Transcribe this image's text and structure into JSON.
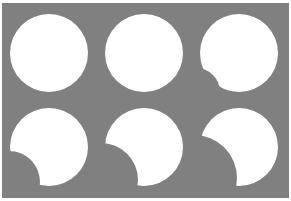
{
  "figure": {
    "width": 291,
    "height": 201,
    "background_color": "#ffffff",
    "panel": {
      "fill_color": "#808080",
      "x": 2,
      "y": 3,
      "width": 287,
      "height": 195
    },
    "shape_fill_color": "#ffffff",
    "rows": 2,
    "columns": 3
  },
  "chart_data": {
    "type": "scatter",
    "xlabel": "",
    "ylabel": "",
    "grid": false,
    "legend": null,
    "background_color": "#808080",
    "shape_color": "#ffffff",
    "categories": [
      "top-left",
      "top-middle",
      "top-right",
      "bottom-left",
      "bottom-middle",
      "bottom-right"
    ],
    "values": [
      0,
      8,
      22,
      38,
      55,
      72
    ],
    "series": [
      {
        "name": "occlusion_percent",
        "values": [
          0,
          8,
          22,
          38,
          55,
          72
        ]
      },
      {
        "name": "notch_radius_px",
        "values": [
          0,
          14,
          24,
          31,
          37,
          43
        ]
      }
    ],
    "ylim": [
      0,
      100
    ],
    "shapes": [
      {
        "index": 0,
        "name": "top-left",
        "cx": 49,
        "cy": 53,
        "r": 39,
        "notch_cx": 0,
        "notch_cy": 0,
        "notch_r": 0,
        "occlusion_percent": 0
      },
      {
        "index": 1,
        "name": "top-middle",
        "cx": 144,
        "cy": 53,
        "r": 39,
        "notch_cx": 101,
        "notch_cy": 95,
        "notch_r": 14,
        "occlusion_percent": 8
      },
      {
        "index": 2,
        "name": "top-right",
        "cx": 239,
        "cy": 53,
        "r": 39,
        "notch_cx": 196,
        "notch_cy": 92,
        "notch_r": 24,
        "occlusion_percent": 22
      },
      {
        "index": 3,
        "name": "bottom-left",
        "cx": 49,
        "cy": 147,
        "r": 39,
        "notch_cx": 9,
        "notch_cy": 182,
        "notch_r": 31,
        "occlusion_percent": 38
      },
      {
        "index": 4,
        "name": "bottom-middle",
        "cx": 144,
        "cy": 147,
        "r": 39,
        "notch_cx": 101,
        "notch_cy": 180,
        "notch_r": 37,
        "occlusion_percent": 55
      },
      {
        "index": 5,
        "name": "bottom-right",
        "cx": 239,
        "cy": 147,
        "r": 39,
        "notch_cx": 194,
        "notch_cy": 178,
        "notch_r": 43,
        "occlusion_percent": 72
      }
    ]
  }
}
